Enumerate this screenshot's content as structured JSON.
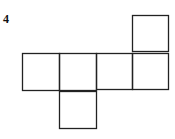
{
  "problem": {
    "number": "4"
  },
  "net": {
    "description": "Cube net of six unit squares",
    "stroke_color": "#222222",
    "squares": [
      {
        "id": "row-1",
        "x": 22,
        "y": 53,
        "size": 37
      },
      {
        "id": "row-2",
        "x": 59,
        "y": 53,
        "size": 37
      },
      {
        "id": "row-3",
        "x": 96,
        "y": 53,
        "size": 36
      },
      {
        "id": "row-4",
        "x": 132,
        "y": 53,
        "size": 36
      },
      {
        "id": "top",
        "x": 132,
        "y": 15,
        "size": 36
      },
      {
        "id": "bottom",
        "x": 59,
        "y": 91,
        "size": 37
      }
    ]
  }
}
